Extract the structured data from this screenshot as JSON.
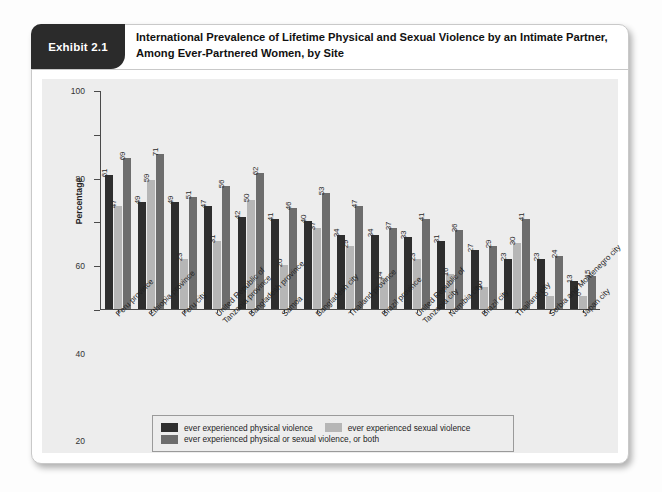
{
  "exhibit": {
    "tag": "Exhibit 2.1",
    "title": "International Prevalence of Lifetime Physical and Sexual Violence by an Intimate Partner, Among Ever-Partnered Women, by Site"
  },
  "colors": {
    "series_physical": "#2e2e2e",
    "series_sexual": "#b6b6b6",
    "series_either": "#6d6d6d",
    "panel_bg": "#ededed",
    "card_bg": "#ffffff",
    "tab_bg": "#2b2b2b",
    "axis": "#4a4a4a"
  },
  "chart_data": {
    "type": "bar",
    "title": "International Prevalence of Lifetime Physical and Sexual Violence by an Intimate Partner, Among Ever-Partnered Women, by Site",
    "xlabel": "",
    "ylabel": "Percentage",
    "ylim": [
      0,
      100
    ],
    "yticks": [
      0,
      20,
      40,
      60,
      80,
      100
    ],
    "grid": false,
    "legend_position": "bottom",
    "categories": [
      "Peru province",
      "Ethiopia province",
      "Peru city",
      "United Republic of Tanzania province",
      "Bangladesh province",
      "Samoa",
      "Bangladesh city",
      "Thailand province",
      "Brazil province",
      "United Republic of Tanzania city",
      "Namibia city",
      "Brazil city",
      "Thailand city",
      "Serbia and Montenegro city",
      "Japan city"
    ],
    "series": [
      {
        "name": "ever experienced physical violence",
        "color": "#2e2e2e",
        "values": [
          61,
          49,
          49,
          47,
          42,
          41,
          40,
          34,
          34,
          33,
          31,
          27,
          23,
          23,
          13
        ]
      },
      {
        "name": "ever experienced sexual violence",
        "color": "#b6b6b6",
        "values": [
          47,
          59,
          23,
          31,
          50,
          20,
          37,
          29,
          14,
          23,
          16,
          10,
          30,
          6,
          6
        ]
      },
      {
        "name": "ever experienced physical or sexual violence, or both",
        "color": "#6d6d6d",
        "values": [
          69,
          71,
          51,
          56,
          62,
          46,
          53,
          47,
          37,
          41,
          36,
          29,
          41,
          24,
          15
        ]
      }
    ]
  },
  "xtick_lines": [
    [
      "Peru province"
    ],
    [
      "Ethiopia province"
    ],
    [
      "Peru city"
    ],
    [
      "United Republic of",
      "Tanzania province"
    ],
    [
      "Bangladesh province"
    ],
    [
      "Samoa"
    ],
    [
      "Bangladesh city"
    ],
    [
      "Thailand province"
    ],
    [
      "Brazil province"
    ],
    [
      "United Republic of",
      "Tanzania city"
    ],
    [
      "Namibia city"
    ],
    [
      "Brazil city"
    ],
    [
      "Thailand city"
    ],
    [
      "Serbia and Montenegro city"
    ],
    [
      "Japan city"
    ]
  ]
}
